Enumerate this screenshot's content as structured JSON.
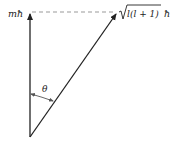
{
  "diagram": {
    "type": "vector-model-angular-momentum",
    "labels": {
      "z_component": "mħ",
      "magnitude_sqrt": "l(l + 1)",
      "magnitude_hbar": "ħ",
      "angle": "θ"
    },
    "colors": {
      "line": "#222222",
      "dashed": "#999999",
      "background": "#ffffff"
    }
  }
}
